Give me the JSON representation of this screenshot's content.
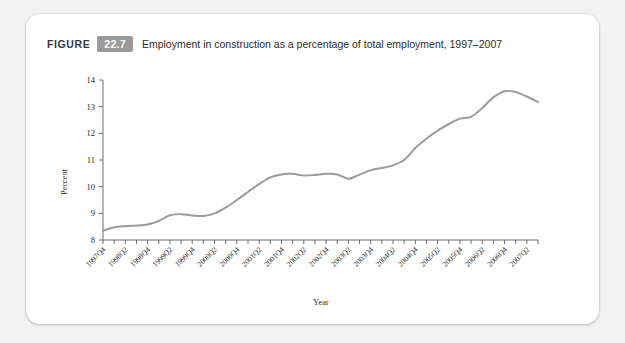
{
  "card": {
    "background_color": "#ffffff",
    "page_background_color": "#f2f2f2"
  },
  "caption": {
    "figure_word": "FIGURE",
    "figure_number": "22.7",
    "badge_color": "#9a9a9a",
    "title": "Employment in construction as a percentage of total employment, 1997–2007"
  },
  "chart_data": {
    "type": "line",
    "title": "Employment in construction as a percentage of total employment, 1997–2007",
    "xlabel": "Year",
    "ylabel": "Percent",
    "ylim": [
      8,
      14
    ],
    "yticks": [
      8,
      9,
      10,
      11,
      12,
      13,
      14
    ],
    "ytick_labels": [
      "8",
      "9",
      "10",
      "11",
      "12",
      "13",
      "14"
    ],
    "grid": false,
    "legend": null,
    "line_color": "#9b9b9b",
    "x_tick_labels_shown": [
      "1997Q4",
      "1998Q2",
      "1998Q4",
      "1999Q2",
      "1999Q4",
      "2000Q2",
      "2000Q4",
      "2001Q2",
      "2001Q4",
      "2002Q2",
      "2002Q4",
      "2003Q2",
      "2003Q4",
      "2004Q2",
      "2004Q4",
      "2005Q2",
      "2005Q4",
      "2006Q2",
      "2006Q4",
      "2007Q2"
    ],
    "x": [
      "1997Q4",
      "1998Q1",
      "1998Q2",
      "1998Q3",
      "1998Q4",
      "1999Q1",
      "1999Q2",
      "1999Q3",
      "1999Q4",
      "2000Q1",
      "2000Q2",
      "2000Q3",
      "2000Q4",
      "2001Q1",
      "2001Q2",
      "2001Q3",
      "2001Q4",
      "2002Q1",
      "2002Q2",
      "2002Q3",
      "2002Q4",
      "2003Q1",
      "2003Q2",
      "2003Q3",
      "2003Q4",
      "2004Q1",
      "2004Q2",
      "2004Q3",
      "2004Q4",
      "2005Q1",
      "2005Q2",
      "2005Q3",
      "2005Q4",
      "2006Q1",
      "2006Q2",
      "2006Q3",
      "2006Q4",
      "2007Q1",
      "2007Q2",
      "2007Q3"
    ],
    "values": [
      8.35,
      8.48,
      8.52,
      8.54,
      8.58,
      8.72,
      8.93,
      8.97,
      8.92,
      8.9,
      9.0,
      9.22,
      9.5,
      9.8,
      10.1,
      10.35,
      10.46,
      10.48,
      10.42,
      10.44,
      10.48,
      10.46,
      10.3,
      10.45,
      10.62,
      10.7,
      10.8,
      11.0,
      11.45,
      11.8,
      12.1,
      12.35,
      12.55,
      12.62,
      12.95,
      13.35,
      13.58,
      13.55,
      13.38,
      13.18
    ]
  }
}
